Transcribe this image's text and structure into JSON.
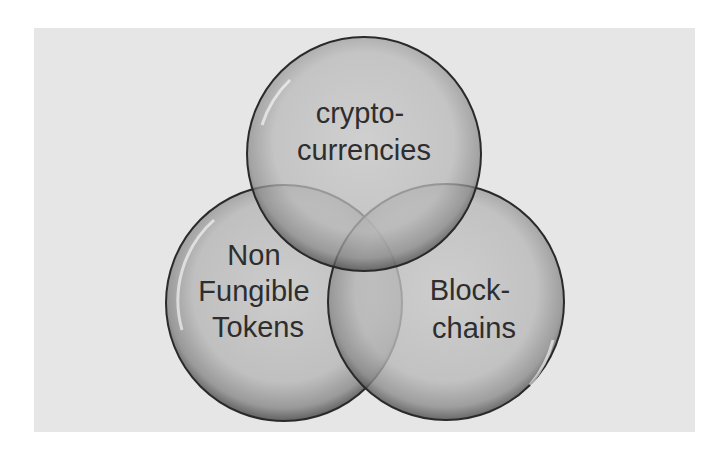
{
  "diagram": {
    "type": "venn",
    "background_color": "#e6e6e6",
    "circle_fill": "#bdbdbd",
    "circle_stroke": "#2a2a2a",
    "sets": [
      {
        "id": "crypto",
        "lines": [
          "crypto-",
          "currencies"
        ],
        "position": "top"
      },
      {
        "id": "nft",
        "lines": [
          "Non",
          "Fungible",
          "Tokens"
        ],
        "position": "bottom-left"
      },
      {
        "id": "blockchain",
        "lines": [
          "Block-",
          "chains"
        ],
        "position": "bottom-right"
      }
    ]
  }
}
